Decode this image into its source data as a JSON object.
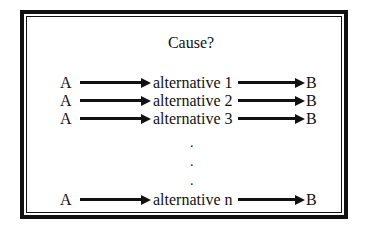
{
  "diagram": {
    "title": "Cause?",
    "rows": [
      {
        "source": "A",
        "middle": "alternative 1",
        "target": "B"
      },
      {
        "source": "A",
        "middle": "alternative 2",
        "target": "B"
      },
      {
        "source": "A",
        "middle": "alternative 3",
        "target": "B"
      },
      {
        "source": "A",
        "middle": "alternative n",
        "target": "B"
      }
    ],
    "ellipsis": [
      ".",
      ".",
      "."
    ],
    "colors": {
      "ink": "#111111",
      "background": "#ffffff"
    }
  }
}
